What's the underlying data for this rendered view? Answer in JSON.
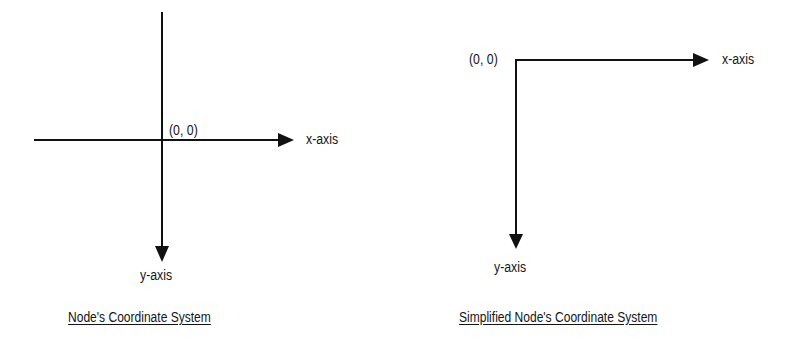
{
  "diagrams": [
    {
      "id": "node-coordinate-system",
      "title": "Node's Coordinate System",
      "origin_label": "(0, 0)",
      "x_axis_label": "x-axis",
      "y_axis_label": "y-axis",
      "origin_position": "center",
      "x_axis_direction": "right",
      "y_axis_direction": "down"
    },
    {
      "id": "simplified-node-coordinate-system",
      "title": "Simplified Node's Coordinate System",
      "origin_label": "(0, 0)",
      "x_axis_label": "x-axis",
      "y_axis_label": "y-axis",
      "origin_position": "top-left",
      "x_axis_direction": "right",
      "y_axis_direction": "down"
    }
  ],
  "colors": {
    "line": "#111111",
    "text": "#151515",
    "background": "#ffffff"
  }
}
